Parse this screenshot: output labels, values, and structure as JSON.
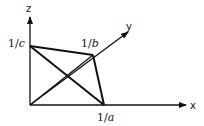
{
  "diagram": {
    "axes": {
      "x": {
        "label": "x"
      },
      "y": {
        "label": "y"
      },
      "z": {
        "label": "z"
      }
    },
    "intercepts": {
      "a": {
        "prefix": "1/",
        "var": "a"
      },
      "b": {
        "prefix": "1/",
        "var": "b"
      },
      "c": {
        "prefix": "1/",
        "var": "c"
      }
    },
    "colors": {
      "line": "#111111",
      "background": "#ffffff"
    }
  }
}
